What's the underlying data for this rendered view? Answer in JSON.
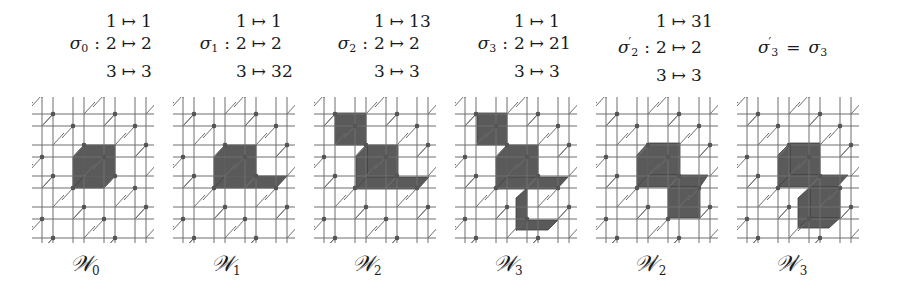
{
  "figure": {
    "mappings": [
      {
        "name": "σ",
        "sub": "0",
        "prime": false,
        "x": 50,
        "rows": [
          {
            "from": "1",
            "to": "1"
          },
          {
            "from": "2",
            "to": "2"
          },
          {
            "from": "3",
            "to": "3"
          }
        ]
      },
      {
        "name": "σ",
        "sub": "1",
        "prime": false,
        "x": 180,
        "rows": [
          {
            "from": "1",
            "to": "1"
          },
          {
            "from": "2",
            "to": "2"
          },
          {
            "from": "3",
            "to": "32"
          }
        ]
      },
      {
        "name": "σ",
        "sub": "2",
        "prime": false,
        "x": 318,
        "rows": [
          {
            "from": "1",
            "to": "13"
          },
          {
            "from": "2",
            "to": "2"
          },
          {
            "from": "3",
            "to": "3"
          }
        ]
      },
      {
        "name": "σ",
        "sub": "3",
        "prime": false,
        "x": 458,
        "rows": [
          {
            "from": "1",
            "to": "1"
          },
          {
            "from": "2",
            "to": "21"
          },
          {
            "from": "3",
            "to": "3"
          }
        ]
      },
      {
        "name": "σ",
        "sub": "2",
        "prime": true,
        "x": 600,
        "rows": [
          {
            "from": "1",
            "to": "31"
          },
          {
            "from": "2",
            "to": "2"
          },
          {
            "from": "3",
            "to": "3"
          }
        ]
      }
    ],
    "equation": {
      "lhs_name": "σ",
      "lhs_sub": "3",
      "lhs_prime": "′",
      "equals": "=",
      "rhs_name": "σ",
      "rhs_sub": "3",
      "x": 758
    },
    "colon": ":",
    "arrow": "↦",
    "panels": [
      {
        "label": "𝒲",
        "sub": "0",
        "prime": "",
        "x0": 32,
        "shaded": [
          [
            [
              52,
              48
            ],
            [
              83,
              48
            ],
            [
              83,
              79
            ],
            [
              52,
              79
            ]
          ],
          [
            [
              41,
              60
            ],
            [
              52,
              48
            ],
            [
              52,
              79
            ],
            [
              41,
              91
            ]
          ],
          [
            [
              41,
              91
            ],
            [
              52,
              79
            ],
            [
              83,
              79
            ],
            [
              72,
              91
            ]
          ]
        ]
      },
      {
        "label": "𝒲",
        "sub": "1",
        "prime": "",
        "x0": 173,
        "shaded": [
          [
            [
              52,
              48
            ],
            [
              83,
              48
            ],
            [
              83,
              79
            ],
            [
              52,
              79
            ]
          ],
          [
            [
              41,
              60
            ],
            [
              52,
              48
            ],
            [
              52,
              79
            ],
            [
              41,
              91
            ]
          ],
          [
            [
              41,
              91
            ],
            [
              52,
              79
            ],
            [
              114,
              79
            ],
            [
              103,
              91
            ]
          ]
        ]
      },
      {
        "label": "𝒲",
        "sub": "2",
        "prime": "",
        "x0": 314,
        "shaded": [
          [
            [
              21,
              16
            ],
            [
              52,
              16
            ],
            [
              52,
              48
            ],
            [
              21,
              48
            ]
          ],
          [
            [
              53,
              48
            ],
            [
              84,
              48
            ],
            [
              84,
              80
            ],
            [
              53,
              80
            ]
          ],
          [
            [
              42,
              60
            ],
            [
              53,
              48
            ],
            [
              53,
              80
            ],
            [
              42,
              92
            ]
          ],
          [
            [
              42,
              92
            ],
            [
              53,
              80
            ],
            [
              115,
              80
            ],
            [
              104,
              92
            ]
          ]
        ]
      },
      {
        "label": "𝒲",
        "sub": "3",
        "prime": "",
        "x0": 455,
        "shaded": [
          [
            [
              22,
              16
            ],
            [
              52,
              16
            ],
            [
              52,
              48
            ],
            [
              22,
              48
            ]
          ],
          [
            [
              52,
              48
            ],
            [
              83,
              48
            ],
            [
              83,
              80
            ],
            [
              52,
              80
            ]
          ],
          [
            [
              41,
              60
            ],
            [
              52,
              48
            ],
            [
              52,
              80
            ],
            [
              41,
              92
            ]
          ],
          [
            [
              41,
              92
            ],
            [
              52,
              80
            ],
            [
              113,
              80
            ],
            [
              102,
              92
            ]
          ],
          [
            [
              61,
              101
            ],
            [
              72,
              91
            ],
            [
              72,
              123
            ],
            [
              61,
              133
            ]
          ],
          [
            [
              61,
              133
            ],
            [
              72,
              123
            ],
            [
              103,
              123
            ],
            [
              93,
              133
            ]
          ]
        ]
      },
      {
        "label": "𝒲",
        "sub": "2",
        "prime": "′",
        "x0": 596,
        "shaded": [
          [
            [
              52,
              46
            ],
            [
              84,
              46
            ],
            [
              84,
              78
            ],
            [
              52,
              78
            ]
          ],
          [
            [
              41,
              58
            ],
            [
              52,
              46
            ],
            [
              52,
              78
            ],
            [
              41,
              90
            ]
          ],
          [
            [
              41,
              90
            ],
            [
              52,
              78
            ],
            [
              112,
              78
            ],
            [
              104,
              90
            ]
          ],
          [
            [
              72,
              90
            ],
            [
              104,
              90
            ],
            [
              104,
              121
            ],
            [
              72,
              121
            ]
          ]
        ]
      },
      {
        "label": "𝒲",
        "sub": "3",
        "prime": "′",
        "x0": 737,
        "shaded": [
          [
            [
              53,
              46
            ],
            [
              83,
              46
            ],
            [
              83,
              78
            ],
            [
              53,
              78
            ]
          ],
          [
            [
              41,
              58
            ],
            [
              53,
              46
            ],
            [
              53,
              78
            ],
            [
              41,
              90
            ]
          ],
          [
            [
              41,
              90
            ],
            [
              53,
              78
            ],
            [
              111,
              78
            ],
            [
              100,
              90
            ]
          ],
          [
            [
              73,
              90
            ],
            [
              103,
              90
            ],
            [
              103,
              121
            ],
            [
              73,
              121
            ]
          ],
          [
            [
              61,
              101
            ],
            [
              73,
              90
            ],
            [
              73,
              121
            ],
            [
              61,
              131
            ]
          ],
          [
            [
              61,
              131
            ],
            [
              73,
              121
            ],
            [
              103,
              121
            ],
            [
              92,
              131
            ]
          ]
        ]
      }
    ],
    "colors": {
      "shade": "#5a5a5a",
      "line": "#6e6e6e",
      "node": "#555555",
      "text": "#1a1a1a"
    }
  }
}
